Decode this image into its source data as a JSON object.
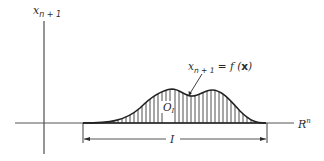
{
  "diagram": {
    "y_axis_label": {
      "base": "x",
      "sub": "n + 1"
    },
    "x_axis_label": {
      "base": "R",
      "sup": "n"
    },
    "curve_label": {
      "base": "x",
      "sub": "n + 1",
      "eq": " = f (",
      "bold": "x",
      "close": ")"
    },
    "region_label": {
      "base": "O",
      "sub": "I"
    },
    "interval_label": "I"
  },
  "colors": {
    "stroke": "#2a2a2a",
    "hatch": "#3a3a3a",
    "background": "#ffffff"
  }
}
